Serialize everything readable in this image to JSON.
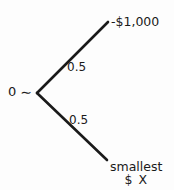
{
  "diagram": {
    "type": "probability-tree",
    "root": {
      "value": "0",
      "relation_symbol": "∼"
    },
    "branches": [
      {
        "id": "upper",
        "probability": "0.5",
        "outcome_line1": "-$1,000",
        "outcome_line2": ""
      },
      {
        "id": "lower",
        "probability": "0.5",
        "outcome_line1": "smallest",
        "outcome_line2": "$ X"
      }
    ],
    "colors": {
      "ink": "#1a1a1a",
      "background": "#fdfdfd"
    }
  }
}
